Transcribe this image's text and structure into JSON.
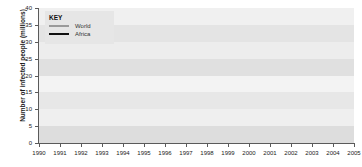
{
  "chart_data": {
    "type": "line",
    "title": "",
    "xlabel": "",
    "ylabel": "Number of infected people (millions)",
    "xlim": [
      1990,
      2005
    ],
    "ylim": [
      0,
      40
    ],
    "grid": "horizontal-bands",
    "legend_position": "top-left",
    "legend_title": "KEY",
    "x": [
      1990,
      1991,
      1992,
      1993,
      1994,
      1995,
      1996,
      1997,
      1998,
      1999,
      2000,
      2001,
      2002,
      2003,
      2004,
      2005
    ],
    "xticklabels": [
      "1990",
      "1991",
      "1992",
      "1993",
      "1994",
      "1995",
      "1996",
      "1997",
      "1998",
      "1999",
      "2000",
      "2001",
      "2002",
      "2003",
      "2004",
      "2005"
    ],
    "yticklabels": [
      "0",
      "5",
      "10",
      "15",
      "20",
      "25",
      "30",
      "35",
      "40"
    ],
    "yticks": [
      0,
      5,
      10,
      15,
      20,
      25,
      30,
      35,
      40
    ],
    "series": [
      {
        "name": "World",
        "color": "#9a9a9a",
        "values": [
          7.5,
          9.5,
          11.5,
          13.5,
          17.5,
          20.5,
          23.0,
          25.5,
          28.0,
          30.0,
          32.0,
          34.0,
          35.5,
          37.0,
          38.0,
          39.0
        ]
      },
      {
        "name": "Africa",
        "color": "#111111",
        "values": [
          5.0,
          6.0,
          7.0,
          8.5,
          10.5,
          12.0,
          13.5,
          15.0,
          16.5,
          18.0,
          19.5,
          21.0,
          22.5,
          23.5,
          24.5,
          25.0
        ]
      }
    ]
  },
  "legend": {
    "title": "KEY",
    "items": [
      {
        "label": "World",
        "color": "#9a9a9a"
      },
      {
        "label": "Africa",
        "color": "#111111"
      }
    ]
  },
  "axes": {
    "y_title": "Number of infected people (millions)"
  }
}
